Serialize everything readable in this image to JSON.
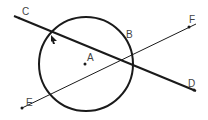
{
  "diagram": {
    "labels": {
      "C": "C",
      "A": "A",
      "B": "B",
      "F": "F",
      "D": "D",
      "E": "E"
    },
    "circle": {
      "cx": 86,
      "cy": 64,
      "r": 47,
      "center_label": "A"
    },
    "lines": [
      {
        "name": "line-CD",
        "from": [
          14,
          16
        ],
        "to": [
          196,
          91
        ],
        "weight": "thick"
      },
      {
        "name": "line-EF",
        "from": [
          22,
          108
        ],
        "to": [
          196,
          24
        ],
        "weight": "thin"
      }
    ],
    "colors": {
      "stroke": "#1a1a1a",
      "label": "#444444"
    }
  }
}
